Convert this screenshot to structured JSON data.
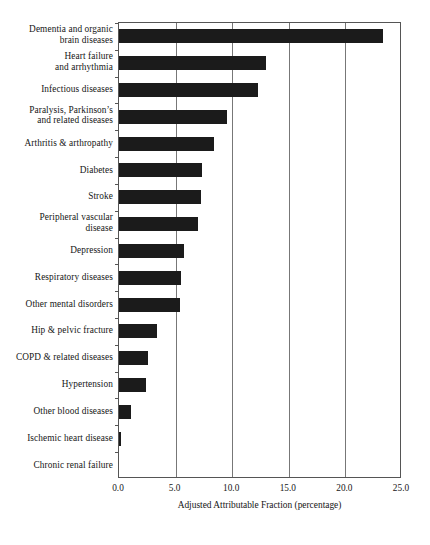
{
  "chart_data": {
    "type": "bar",
    "orientation": "horizontal",
    "title": "",
    "xlabel": "Adjusted Attributable Fraction (percentage)",
    "ylabel": "",
    "xlim": [
      0.0,
      25.0
    ],
    "xticks": [
      "0.0",
      "5.0",
      "10.0",
      "15.0",
      "20.0",
      "25.0"
    ],
    "xtick_values": [
      0.0,
      5.0,
      10.0,
      15.0,
      20.0,
      25.0
    ],
    "grid": true,
    "legend": "none",
    "bar_color": "#1b1b1b",
    "categories": [
      "Dementia and organic brain diseases",
      "Heart failure and arrhythmia",
      "Infectious diseases",
      "Paralysis, Parkinson’s and related diseases",
      "Arthritis & arthropathy",
      "Diabetes",
      "Stroke",
      "Peripheral vascular disease",
      "Depression",
      "Respiratory diseases",
      "Other mental disorders",
      "Hip & pelvic fracture",
      "COPD & related diseases",
      "Hypertension",
      "Other blood diseases",
      "Ischemic heart disease",
      "Chronic renal failure"
    ],
    "category_lines": [
      [
        "Dementia and organic",
        "brain diseases"
      ],
      [
        "Heart failure",
        "and arrhythmia"
      ],
      [
        "Infectious diseases"
      ],
      [
        "Paralysis, Parkinson’s",
        "and related diseases"
      ],
      [
        "Arthritis & arthropathy"
      ],
      [
        "Diabetes"
      ],
      [
        "Stroke"
      ],
      [
        "Peripheral vascular",
        "disease"
      ],
      [
        "Depression"
      ],
      [
        "Respiratory diseases"
      ],
      [
        "Other mental disorders"
      ],
      [
        "Hip & pelvic fracture"
      ],
      [
        "COPD & related diseases"
      ],
      [
        "Hypertension"
      ],
      [
        "Other blood diseases"
      ],
      [
        "Ischemic heart disease"
      ],
      [
        "Chronic renal failure"
      ]
    ],
    "values": [
      23.3,
      13.0,
      12.3,
      9.5,
      8.4,
      7.3,
      7.2,
      7.0,
      5.7,
      5.5,
      5.35,
      3.35,
      2.6,
      2.35,
      1.1,
      0.15,
      0.0
    ]
  }
}
